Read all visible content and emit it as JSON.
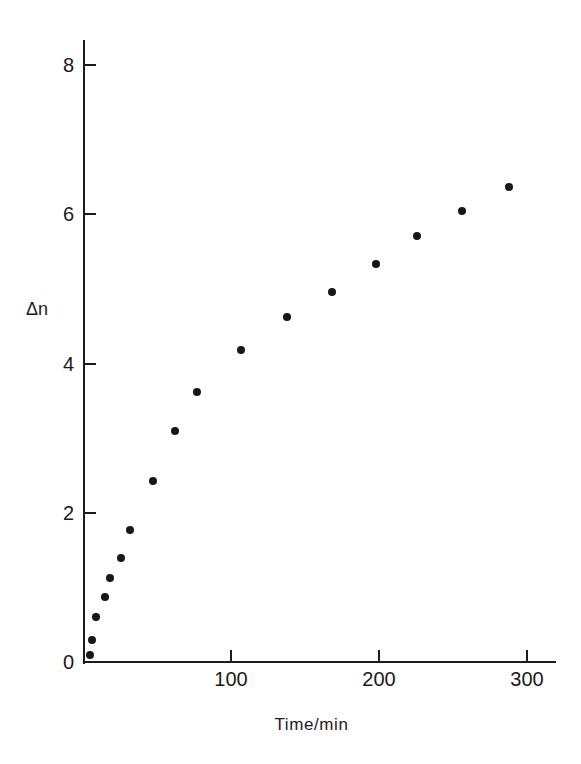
{
  "chart_data": {
    "type": "scatter",
    "title": "",
    "subtitle": "",
    "xlabel": "Time/min",
    "ylabel": "Δn",
    "xlim": [
      0,
      320
    ],
    "ylim": [
      0,
      8.6
    ],
    "xticks": [
      100,
      200,
      300
    ],
    "yticks": [
      0,
      2,
      4,
      6,
      8
    ],
    "xtick_labels": [
      "100",
      "200",
      "300"
    ],
    "ytick_labels": [
      "0",
      "2",
      "4",
      "6",
      "8"
    ],
    "grid": false,
    "legend": null,
    "legend_position": "none",
    "marker": "filled-circle",
    "marker_color": "#171717",
    "annotations": [],
    "x": [
      5,
      6,
      9,
      15,
      18,
      26,
      32,
      47,
      62,
      77,
      107,
      138,
      168,
      198,
      226,
      256,
      288
    ],
    "y": [
      0.1,
      0.3,
      0.6,
      0.87,
      1.13,
      1.4,
      1.77,
      2.43,
      3.1,
      3.62,
      4.18,
      4.62,
      4.96,
      5.33,
      5.71,
      6.04,
      6.37
    ],
    "points": [
      {
        "x": 5,
        "y": 0.1
      },
      {
        "x": 6,
        "y": 0.3
      },
      {
        "x": 9,
        "y": 0.6
      },
      {
        "x": 15,
        "y": 0.87
      },
      {
        "x": 18,
        "y": 1.13
      },
      {
        "x": 26,
        "y": 1.4
      },
      {
        "x": 32,
        "y": 1.77
      },
      {
        "x": 47,
        "y": 2.43
      },
      {
        "x": 62,
        "y": 3.1
      },
      {
        "x": 77,
        "y": 3.62
      },
      {
        "x": 107,
        "y": 4.18
      },
      {
        "x": 138,
        "y": 4.62
      },
      {
        "x": 168,
        "y": 4.96
      },
      {
        "x": 198,
        "y": 5.33
      },
      {
        "x": 226,
        "y": 5.71
      },
      {
        "x": 256,
        "y": 6.04
      },
      {
        "x": 288,
        "y": 6.37
      }
    ]
  },
  "axes": {
    "y_label": "Δn",
    "x_label": "Time/min",
    "y_tick_labels": [
      "0",
      "2",
      "4",
      "6",
      "8"
    ],
    "x_tick_labels": [
      "100",
      "200",
      "300"
    ],
    "axis_color": "#1c1c1c"
  },
  "colors": {
    "background": "#ffffff",
    "ink": "#1a1a1a",
    "marker": "#171717"
  }
}
